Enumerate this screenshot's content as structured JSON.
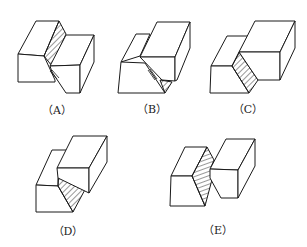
{
  "figures": [
    {
      "id": "A",
      "label": "（A）"
    },
    {
      "id": "B",
      "label": "（B）"
    },
    {
      "id": "C",
      "label": "（C）"
    },
    {
      "id": "D",
      "label": "（D）"
    },
    {
      "id": "E",
      "label": "（E）"
    }
  ]
}
